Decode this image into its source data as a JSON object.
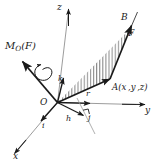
{
  "figure": {
    "type": "vector-mechanics-diagram",
    "background_color": "#ffffff",
    "line_color": "#1a1a1a",
    "hatch_color": "#555555",
    "width": 159,
    "height": 166
  },
  "axes": {
    "z_label": "z",
    "y_label": "y",
    "x_label": "x",
    "origin_label": "O"
  },
  "unit_vectors": {
    "k_label": "k",
    "j_label": "j",
    "i_label": "i"
  },
  "points": {
    "A_name": "A",
    "A_coords": "(x ,y ,z)",
    "A_full": "A(x ,y ,z)",
    "B_label": "B"
  },
  "vectors": {
    "force_label": "F",
    "position_label": "r",
    "distance_label": "h",
    "moment_label": "M",
    "moment_subscript": "O",
    "moment_arg": "(F)",
    "moment_full": "M_O(F)"
  },
  "annotations": {
    "right_angle_marker": "right-angle",
    "hatched_region": "triangle-OAB",
    "rotation_arrow": "curved-moment-sense"
  }
}
